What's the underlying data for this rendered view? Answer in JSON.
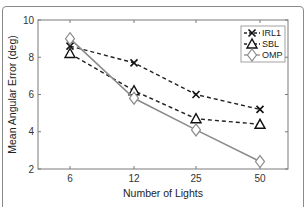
{
  "chart_data": {
    "type": "line",
    "title": "",
    "xlabel": "Number of Lights",
    "ylabel": "Mean Angular Error (deg)",
    "categories": [
      "6",
      "12",
      "25",
      "50"
    ],
    "ylim": [
      2,
      10
    ],
    "yticks": [
      "2",
      "4",
      "6",
      "8",
      "10"
    ],
    "grid": false,
    "legend_position": "top-right",
    "series": [
      {
        "name": "IRL1",
        "marker": "x",
        "line_style": "dashed",
        "color": "#222222",
        "values": [
          8.6,
          7.7,
          6.0,
          5.2
        ]
      },
      {
        "name": "SBL",
        "marker": "triangle",
        "line_style": "dashed",
        "color": "#222222",
        "values": [
          8.2,
          6.2,
          4.7,
          4.4
        ]
      },
      {
        "name": "OMP",
        "marker": "diamond",
        "line_style": "solid",
        "color": "#8c8c8c",
        "values": [
          9.0,
          5.8,
          4.1,
          2.4
        ]
      }
    ]
  }
}
